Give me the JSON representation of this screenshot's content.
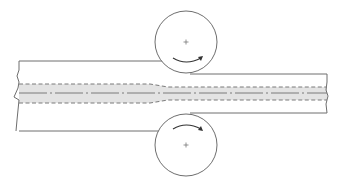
{
  "diagram": {
    "type": "rolling-process-schematic",
    "colors": {
      "outline": "#6e6e6e",
      "band_fill": "#e3e3e3",
      "arrow": "#333333",
      "background": "#ffffff"
    },
    "elements": {
      "workpiece_incoming": {
        "top_y": 61,
        "bottom_y": 131,
        "left_x": 19
      },
      "workpiece_outgoing": {
        "top_y": 74,
        "bottom_y": 113,
        "right_x": 327
      },
      "core_band_incoming": {
        "top_y": 84,
        "bottom_y": 103
      },
      "core_band_outgoing": {
        "top_y": 87,
        "bottom_y": 100
      },
      "centerline_y": 93,
      "taper_start_x": 150,
      "taper_end_x": 168,
      "top_roll": {
        "cx": 186,
        "cy": 42,
        "r": 31,
        "rotation": "clockwise"
      },
      "bottom_roll": {
        "cx": 186,
        "cy": 145,
        "r": 31,
        "rotation": "counterclockwise"
      }
    }
  }
}
